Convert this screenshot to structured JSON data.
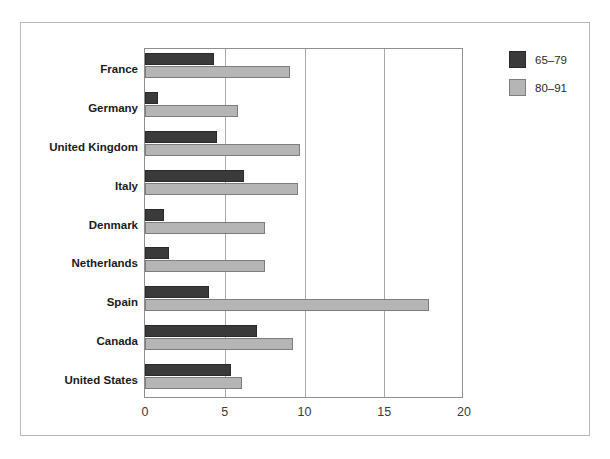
{
  "chart_data": {
    "type": "bar",
    "orientation": "horizontal",
    "title": "",
    "subtitle": "",
    "xlabel": "",
    "ylabel": "",
    "xlim": [
      0,
      20
    ],
    "xticks": [
      "0",
      "5",
      "10",
      "15",
      "20"
    ],
    "xtick_values": [
      0,
      5,
      10,
      15,
      20
    ],
    "grid": "vertical",
    "legend_position": "right-top",
    "categories": [
      "France",
      "Germany",
      "United Kingdom",
      "Italy",
      "Denmark",
      "Netherlands",
      "Spain",
      "Canada",
      "United States"
    ],
    "series": [
      {
        "name": "65–79",
        "color": "#3a3a3a",
        "values": [
          4.3,
          0.8,
          4.5,
          6.2,
          1.2,
          1.5,
          4.0,
          7.0,
          5.4
        ]
      },
      {
        "name": "80–91",
        "color": "#b5b5b5",
        "values": [
          9.1,
          5.8,
          9.7,
          9.6,
          7.5,
          7.5,
          17.8,
          9.3,
          6.1
        ]
      }
    ]
  },
  "colors": {
    "series_dark": "#3a3a3a",
    "series_light": "#b5b5b5",
    "axis": "#8f8f8f",
    "grid": "#a8a8a8",
    "frame": "#b9b9b9",
    "text": "#1b1b1b"
  }
}
